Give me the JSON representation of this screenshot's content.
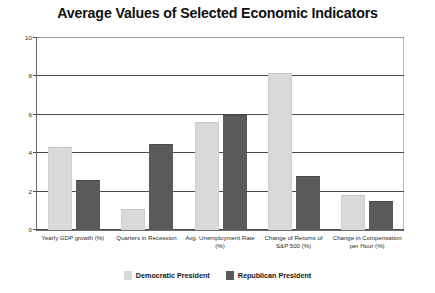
{
  "chart_data": {
    "type": "bar",
    "title": "Average Values of Selected Economic Indicators",
    "xlabel": "",
    "ylabel": "",
    "ylim": [
      0,
      10
    ],
    "yticks": [
      0,
      2,
      4,
      6,
      8,
      10
    ],
    "grid": true,
    "legend_position": "bottom",
    "categories": [
      "Yearly GDP growth (%)",
      "Quarters in Recession",
      "Avg. Unemployment Rate (%)",
      "Change of Returns of S&P 500 (%)",
      "Change in Compensation per Hour (%)"
    ],
    "series": [
      {
        "name": "Democratic President",
        "color": "#d9d9d9",
        "values": [
          4.3,
          1.1,
          5.6,
          8.2,
          1.8
        ]
      },
      {
        "name": "Republican President",
        "color": "#5a5a5a",
        "values": [
          2.6,
          4.5,
          6.0,
          2.8,
          1.5
        ]
      }
    ]
  },
  "axis": {
    "y_tick_labels": [
      "0",
      "2",
      "4",
      "6",
      "8",
      "10"
    ]
  },
  "legend": {
    "items": [
      {
        "label": "Democratic President",
        "swatch": "light-gray-swatch"
      },
      {
        "label": "Republican President",
        "swatch": "dark-gray-swatch"
      }
    ]
  }
}
